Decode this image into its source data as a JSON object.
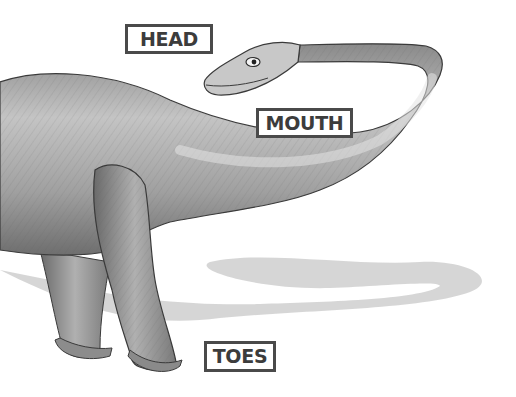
{
  "labels": {
    "head": "HEAD",
    "mouth": "MOUTH",
    "toes": "TOES"
  },
  "illustration": {
    "subject": "sauropod dinosaur (side view, long neck, pencil-shaded)",
    "colors": {
      "body_light": "#d8d8d8",
      "body_mid": "#a8a8a8",
      "body_dark": "#6a6a6a",
      "outline": "#3a3a3a",
      "shadow": "#c9c9c9",
      "label_border": "#4a4a4a",
      "label_text": "#3c3c3c"
    }
  }
}
